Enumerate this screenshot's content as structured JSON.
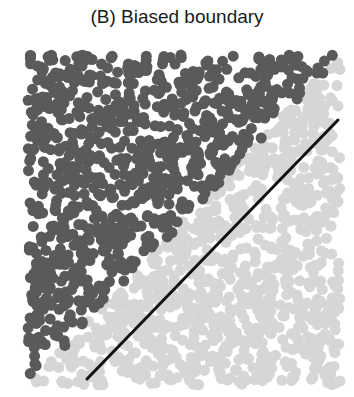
{
  "chart_data": {
    "type": "scatter",
    "title": "(B) Biased boundary",
    "xlabel": "",
    "ylabel": "",
    "grid": false,
    "legend": null,
    "axes_visible": false,
    "series": [
      {
        "name": "class A (above true diagonal)",
        "color": "#5a5a5a",
        "approx_count": 900,
        "region": "upper-left triangle"
      },
      {
        "name": "class B (below true diagonal)",
        "color": "#d6d6d6",
        "approx_count": 900,
        "region": "lower-right triangle"
      }
    ],
    "true_boundary": {
      "from": [
        0,
        0
      ],
      "to": [
        1,
        1
      ],
      "note": "implicit diagonal separating classes"
    },
    "decision_boundary": {
      "color": "#111111",
      "from_px": [
        87,
        379
      ],
      "to_px": [
        338,
        120
      ],
      "normalized_from": [
        0.19,
        0.02
      ],
      "normalized_to": [
        0.99,
        0.8
      ]
    },
    "plot_area_px": {
      "x0": 28,
      "y0": 55,
      "x1": 340,
      "y1": 385
    },
    "point_radius_px": 5.5,
    "point_count": 1800,
    "seed": 7
  }
}
